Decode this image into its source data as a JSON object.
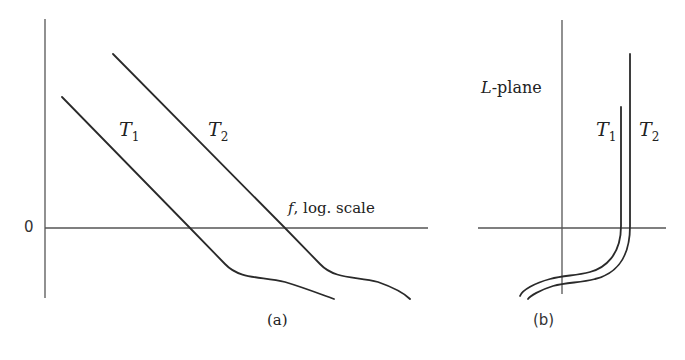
{
  "panel_a": {
    "zero_label": "0",
    "x_axis_label_var": "f",
    "x_axis_label_rest": ", log. scale",
    "curve1_label": "T",
    "curve1_sub": "1",
    "curve2_label": "T",
    "curve2_sub": "2",
    "caption": "(a)"
  },
  "panel_b": {
    "plane_label_var": "L",
    "plane_label_rest": "-plane",
    "curve1_label": "T",
    "curve1_sub": "1",
    "curve2_label": "T",
    "curve2_sub": "2",
    "caption": "(b)"
  }
}
